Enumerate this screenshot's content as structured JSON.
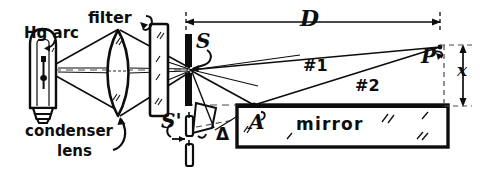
{
  "diagram": {
    "ink_color": "#0d0d0d",
    "background_color": "#ffffff"
  },
  "labels": {
    "source": "Hg arc",
    "filter": "filter",
    "condenser_line1": "condenser",
    "condenser_line2": "lens",
    "slit": "S",
    "slit_image": "S'",
    "distance_D": "D",
    "height_x": "x",
    "ray_one": "#1",
    "ray_two": "#2",
    "point_P": "P",
    "point_A": "A",
    "mirror": "mirror",
    "delta": "Δ"
  },
  "components": {
    "lamp": {
      "name": "mercury-arc-lamp",
      "shape": "bulb-with-screw-base"
    },
    "condenser_lens": {
      "name": "condenser-lens",
      "shape": "biconvex"
    },
    "filter": {
      "name": "filter-plate",
      "shape": "rectangle"
    },
    "slit": {
      "name": "slit-S",
      "shape": "two-opaque-bars-with-gap"
    },
    "slit_image": {
      "name": "slit-image-S-prime",
      "shape": "two-opaque-bars-with-gap"
    },
    "mirror": {
      "name": "mirror-block",
      "shape": "long-rectangle"
    }
  },
  "rays": {
    "ray1_description": "direct ray from S to P",
    "ray2_description": "ray from S reflecting at A on mirror up to P"
  },
  "dimensions": {
    "D_description": "horizontal distance from slit S to screen point P",
    "x_description": "vertical height of P above mirror surface"
  }
}
